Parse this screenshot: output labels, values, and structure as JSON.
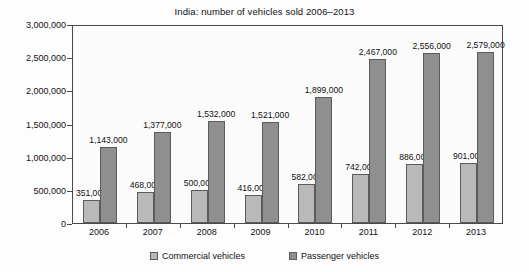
{
  "chart_data": {
    "type": "bar",
    "title": "India: number of vehicles sold 2006–2013",
    "xlabel": "",
    "ylabel": "",
    "ylim": [
      0,
      3000000
    ],
    "grid": false,
    "legend_position": "bottom",
    "categories": [
      "2006",
      "2007",
      "2008",
      "2009",
      "2010",
      "2011",
      "2012",
      "2013"
    ],
    "ytick_labels": [
      "0",
      "500,000",
      "1,000,000",
      "1,500,000",
      "2,000,000",
      "2,500,000",
      "3,000,000"
    ],
    "ytick_values": [
      0,
      500000,
      1000000,
      1500000,
      2000000,
      2500000,
      3000000
    ],
    "series": [
      {
        "name": "Commercial vehicles",
        "color": "#b9b9b9",
        "values": [
          351000,
          468000,
          500000,
          416000,
          582000,
          742000,
          886000,
          901000
        ],
        "data_labels": [
          "351,000",
          "468,000",
          "500,000",
          "416,000",
          "582,000",
          "742,000",
          "886,000",
          "901,000"
        ]
      },
      {
        "name": "Passenger vehicles",
        "color": "#8f8f8f",
        "values": [
          1143000,
          1377000,
          1532000,
          1521000,
          1899000,
          2467000,
          2556000,
          2579000
        ],
        "data_labels": [
          "1,143,000",
          "1,377,000",
          "1,532,000",
          "1,521,000",
          "1,899,000",
          "2,467,000",
          "2,556,000",
          "2,579,000"
        ]
      }
    ]
  },
  "legend": {
    "items": [
      {
        "label": "Commercial vehicles",
        "swatch": "commercial"
      },
      {
        "label": "Passenger vehicles",
        "swatch": "passenger"
      }
    ]
  }
}
